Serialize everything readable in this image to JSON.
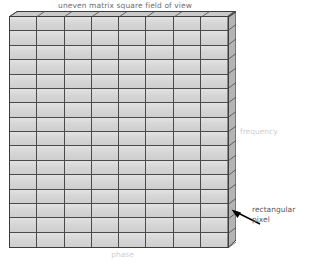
{
  "figure": {
    "title": "uneven matrix square field of view",
    "type": "mri-k-space-matrix-diagram",
    "grid": {
      "columns": 8,
      "rows": 16,
      "cell_fill": "#d6d6d6",
      "line_color": "#4a4a4a",
      "top_face_fill": "#c9c9c9",
      "right_face_fill": "#b4b4b4"
    },
    "axes": {
      "horizontal_label": "phase",
      "vertical_label": "frequency",
      "label_color": "#cfcfcf"
    },
    "callout": {
      "line1": "rectangular",
      "line2": "pixel",
      "arrow_icon": "arrow-up-left-icon",
      "text_color": "#5a5a5a"
    },
    "title_color": "#6f6f6f"
  }
}
